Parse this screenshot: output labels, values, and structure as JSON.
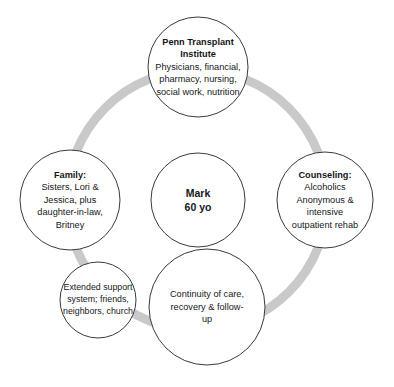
{
  "diagram": {
    "type": "concentric-network-circles",
    "canvas": {
      "width": 394,
      "height": 387,
      "background": "#ffffff"
    },
    "ring": {
      "name": "connecting-ring",
      "color": "#c9c9c9",
      "center_x": 197,
      "center_y": 200,
      "radius": 130,
      "stroke_width": 9
    },
    "circle_outline_color": "#3a3a3f",
    "circle_fill_color": "#ffffff",
    "center_node": {
      "title": "Mark",
      "subtitle": "60 yo",
      "cx": 198,
      "cy": 200,
      "r": 47,
      "font_size": 10.5,
      "line_height": 14
    },
    "nodes": [
      {
        "id": "penn-transplant-institute",
        "title": "Penn Transplant Institute",
        "body": "Physicians, financial, pharmacy, nursing, social work, nutrition",
        "cx": 198,
        "cy": 67,
        "r": 50,
        "box_width": 94,
        "font_size": 9.2,
        "line_height": 12.4
      },
      {
        "id": "family",
        "title": "Family:",
        "body": "Sisters, Lori & Jessica, plus daughter-in-law, Britney",
        "cx": 70,
        "cy": 200,
        "r": 50,
        "box_width": 92,
        "font_size": 9.2,
        "line_height": 12.4
      },
      {
        "id": "counseling",
        "title": "Counseling:",
        "body": "Alcoholics Anonymous & intensive outpatient rehab",
        "cx": 325,
        "cy": 200,
        "r": 48,
        "box_width": 78,
        "font_size": 9.2,
        "line_height": 12.4
      },
      {
        "id": "extended-support-system",
        "title": "",
        "body": "Extended support system; friends, neighbors, church",
        "cx": 98,
        "cy": 300,
        "r": 38,
        "box_width": 86,
        "font_size": 8.8,
        "line_height": 11.8
      },
      {
        "id": "continuity-of-care",
        "title": "",
        "body": "Continuity of care, recovery & follow-up",
        "cx": 207,
        "cy": 307,
        "r": 58,
        "box_width": 82,
        "font_size": 9.2,
        "line_height": 12.8
      }
    ]
  }
}
